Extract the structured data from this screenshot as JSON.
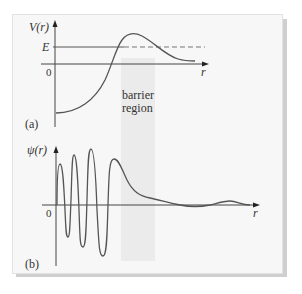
{
  "figure": {
    "panel_a": {
      "tag": "(a)",
      "y_axis_label": "V(r)",
      "energy_label": "E",
      "origin_label": "0",
      "x_axis_label": "r",
      "region_label_line1": "barrier",
      "region_label_line2": "region"
    },
    "panel_b": {
      "tag": "(b)",
      "y_axis_label": "ψ(r)",
      "origin_label": "0",
      "x_axis_label": "r"
    },
    "colors": {
      "panel_background": "#f7f7f7",
      "barrier_band": "#ebebeb",
      "curve": "#555555",
      "axis": "#444444",
      "shadow": "#cfcfcf"
    }
  }
}
